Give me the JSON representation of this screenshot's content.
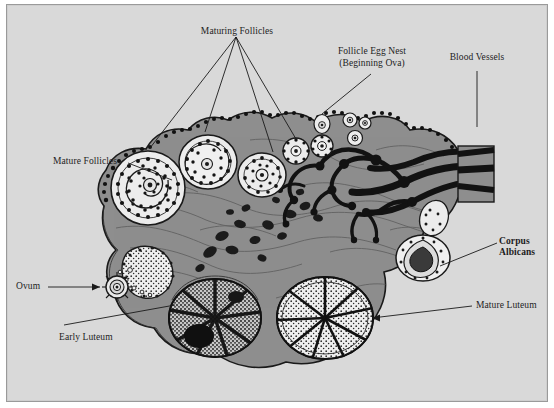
{
  "figure": {
    "background_color": "#d9d9d9",
    "frame_border_color": "#9a9a9a",
    "stroma_color": "#8a8a8a",
    "ink_color": "#1a1a1a",
    "highlight_color": "#e8e8e8"
  },
  "labels": {
    "maturing_follicles": "Maturing Follicles",
    "follicle_egg_nest_line1": "Follicle Egg Nest",
    "follicle_egg_nest_line2": "(Beginning Ova)",
    "blood_vessels": "Blood Vessels",
    "mature_follicles": "Mature Follicles",
    "ovum": "Ovum",
    "early_luteum": "Early Luteum",
    "corpus_albicans_line1": "Corpus",
    "corpus_albicans_line2": "Albicans",
    "mature_luteum": "Mature Luteum"
  },
  "structures": [
    {
      "name": "mature-follicle-large",
      "label": "Mature Follicles",
      "cx": 148,
      "cy": 188,
      "r": 36
    },
    {
      "name": "maturing-follicle-1",
      "label": "Maturing Follicles",
      "cx": 208,
      "cy": 162,
      "r": 27
    },
    {
      "name": "maturing-follicle-2",
      "label": "Maturing Follicles",
      "cx": 262,
      "cy": 175,
      "r": 23
    },
    {
      "name": "maturing-follicle-3",
      "label": "Maturing Follicles",
      "cx": 295,
      "cy": 150,
      "r": 13
    },
    {
      "name": "maturing-follicle-4",
      "label": "Maturing Follicles",
      "cx": 320,
      "cy": 145,
      "r": 11
    },
    {
      "name": "egg-nest-1",
      "label": "Follicle Egg Nest",
      "cx": 323,
      "cy": 123,
      "r": 8
    },
    {
      "name": "egg-nest-2",
      "label": "Follicle Egg Nest",
      "cx": 348,
      "cy": 120,
      "r": 7
    },
    {
      "name": "egg-nest-3",
      "label": "Follicle Egg Nest",
      "cx": 363,
      "cy": 122,
      "r": 6
    },
    {
      "name": "egg-nest-4",
      "label": "Follicle Egg Nest",
      "cx": 354,
      "cy": 138,
      "r": 7
    },
    {
      "name": "blood-vessel-hilum",
      "label": "Blood Vessels",
      "cx": 455,
      "cy": 165,
      "r": 0
    },
    {
      "name": "released-ovum",
      "label": "Ovum",
      "cx": 117,
      "cy": 287,
      "r": 11
    },
    {
      "name": "ruptured-follicle",
      "label": "Ovum release site",
      "cx": 148,
      "cy": 268,
      "r": 22
    },
    {
      "name": "early-luteum",
      "label": "Early Luteum",
      "cx": 215,
      "cy": 318,
      "r": 44
    },
    {
      "name": "mature-luteum",
      "label": "Mature Luteum",
      "cx": 325,
      "cy": 318,
      "r": 46
    },
    {
      "name": "corpus-albicans",
      "label": "Corpus Albicans",
      "cx": 422,
      "cy": 258,
      "r": 26
    }
  ]
}
